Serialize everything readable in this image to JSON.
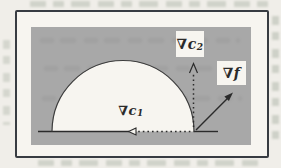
{
  "theme": {
    "paper": "#f0eee9",
    "panel-white": "#f7f5f0",
    "region-gray": "#a8a8a8",
    "ink": "#2b2b2b",
    "frame": "#383c42",
    "bleed": "#8a9684",
    "bleed-dark": "#5a5a5a"
  },
  "figure": {
    "labels": {
      "grad_c2": {
        "nabla": "∇",
        "symbol": "c",
        "subscript": "2"
      },
      "grad_f": {
        "nabla": "∇",
        "symbol": "f"
      },
      "grad_c1": {
        "nabla": "∇",
        "symbol": "c",
        "subscript": "1"
      }
    }
  }
}
